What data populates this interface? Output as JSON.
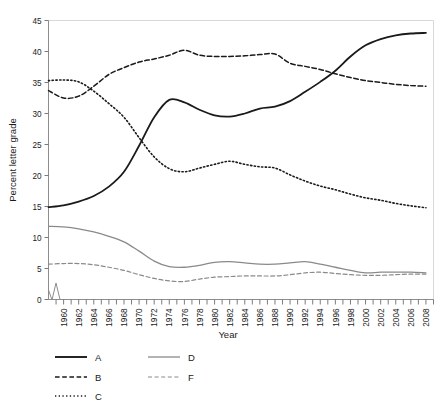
{
  "chart_data": {
    "type": "line",
    "title": "",
    "xlabel": "Year",
    "ylabel": "Percent letter grade",
    "xlim": [
      1958,
      2009
    ],
    "ylim": [
      0,
      45
    ],
    "yticks": [
      0,
      5,
      10,
      15,
      20,
      25,
      30,
      35,
      40,
      45
    ],
    "xticks": [
      1960,
      1962,
      1964,
      1966,
      1968,
      1970,
      1972,
      1974,
      1976,
      1978,
      1980,
      1982,
      1984,
      1986,
      1988,
      1990,
      1992,
      1994,
      1996,
      1998,
      2000,
      2002,
      2004,
      2006,
      2008
    ],
    "xtick_labels": [
      "1960",
      "1962",
      "1964",
      "1966",
      "1968",
      "1970",
      "1972",
      "1974",
      "1976",
      "1978",
      "1980",
      "1982",
      "1984",
      "1986",
      "1988",
      "1990",
      "1992",
      "1994",
      "1996",
      "1998",
      "2000",
      "2002",
      "2004",
      "2006",
      "2008"
    ],
    "ytick_labels": [
      "0",
      "5",
      "10",
      "15",
      "20",
      "25",
      "30",
      "35",
      "40",
      "45"
    ],
    "grid": false,
    "axis_break": true,
    "legend_position": "below-left",
    "x": [
      1958,
      1960,
      1962,
      1964,
      1966,
      1968,
      1970,
      1972,
      1974,
      1976,
      1978,
      1980,
      1982,
      1984,
      1986,
      1988,
      1990,
      1992,
      1994,
      1996,
      1998,
      2000,
      2002,
      2004,
      2006,
      2008
    ],
    "series": [
      {
        "name": "A",
        "color": "#1a1a1a",
        "style": "solid",
        "width": 1.8,
        "values": [
          14.9,
          15.2,
          15.8,
          16.7,
          18.2,
          20.6,
          24.8,
          29.4,
          32.2,
          31.8,
          30.6,
          29.7,
          29.5,
          30.0,
          30.8,
          31.1,
          32.0,
          33.5,
          35.1,
          36.9,
          39.2,
          41.0,
          42.0,
          42.6,
          42.9,
          43.0
        ]
      },
      {
        "name": "B",
        "color": "#1a1a1a",
        "style": "dashed",
        "width": 1.5,
        "values": [
          33.7,
          32.5,
          32.8,
          34.4,
          36.3,
          37.4,
          38.3,
          38.8,
          39.4,
          40.2,
          39.4,
          39.2,
          39.2,
          39.3,
          39.5,
          39.6,
          38.1,
          37.6,
          37.1,
          36.4,
          35.8,
          35.3,
          35.0,
          34.7,
          34.5,
          34.4
        ]
      },
      {
        "name": "C",
        "color": "#1a1a1a",
        "style": "dotted",
        "width": 1.6,
        "values": [
          35.3,
          35.4,
          35.1,
          33.6,
          31.6,
          29.4,
          26.1,
          23.0,
          21.1,
          20.6,
          21.2,
          21.8,
          22.3,
          21.8,
          21.4,
          21.2,
          20.1,
          19.1,
          18.3,
          17.7,
          17.0,
          16.4,
          16.0,
          15.5,
          15.1,
          14.8
        ]
      },
      {
        "name": "D",
        "color": "#8a8a8a",
        "style": "solid",
        "width": 1.3,
        "values": [
          11.8,
          11.7,
          11.4,
          10.9,
          10.2,
          9.3,
          7.8,
          6.2,
          5.3,
          5.2,
          5.5,
          6.0,
          6.1,
          5.9,
          5.7,
          5.7,
          5.9,
          6.1,
          5.7,
          5.2,
          4.7,
          4.3,
          4.4,
          4.4,
          4.4,
          4.3
        ]
      },
      {
        "name": "F",
        "color": "#8a8a8a",
        "style": "dashed",
        "width": 1.2,
        "values": [
          5.7,
          5.8,
          5.8,
          5.6,
          5.2,
          4.7,
          4.0,
          3.4,
          3.0,
          2.9,
          3.3,
          3.6,
          3.7,
          3.8,
          3.8,
          3.8,
          4.0,
          4.3,
          4.4,
          4.2,
          4.0,
          3.9,
          3.9,
          4.0,
          4.1,
          4.1
        ]
      }
    ],
    "legend": [
      {
        "label": "A",
        "color": "#1a1a1a",
        "style": "solid",
        "width": 1.9
      },
      {
        "label": "D",
        "color": "#8a8a8a",
        "style": "solid",
        "width": 1.3
      },
      {
        "label": "B",
        "color": "#1a1a1a",
        "style": "dashed",
        "width": 1.5
      },
      {
        "label": "F",
        "color": "#8a8a8a",
        "style": "dashed",
        "width": 1.2
      },
      {
        "label": "C",
        "color": "#1a1a1a",
        "style": "dotted",
        "width": 1.7
      }
    ]
  }
}
